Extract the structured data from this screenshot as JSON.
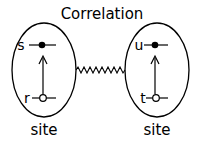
{
  "title": "Correlation",
  "sites": [
    {
      "label": "site",
      "top_state": "s",
      "bottom_state": "r"
    },
    {
      "label": "site",
      "top_state": "u",
      "bottom_state": "t"
    }
  ],
  "colors": {
    "stroke": "#000000",
    "background": "#ffffff"
  }
}
